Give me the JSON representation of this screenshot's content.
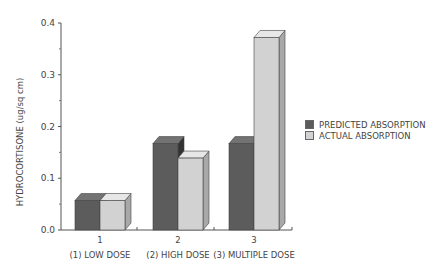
{
  "chart_data": {
    "type": "bar",
    "style": "3d-clustered",
    "title": "",
    "xlabel": "",
    "ylabel": "HYDROCORTISONE (ug/sq cm)",
    "ylim": [
      0,
      0.4
    ],
    "yticks": [
      "0.0",
      "0.1",
      "0.2",
      "0.3",
      "0.4"
    ],
    "categories": [
      "1",
      "2",
      "3"
    ],
    "category_descriptions": [
      "(1) LOW DOSE",
      "(2) HIGH DOSE",
      "(3) MULTIPLE DOSE"
    ],
    "series": [
      {
        "name": "PREDICTED ABSORPTION",
        "color": "#5c5c5c",
        "values": [
          0.057,
          0.167,
          0.167
        ]
      },
      {
        "name": "ACTUAL ABSORPTION",
        "color": "#d2d2d2",
        "values": [
          0.057,
          0.139,
          0.372
        ]
      }
    ],
    "legend_position": "right",
    "grid": false
  }
}
